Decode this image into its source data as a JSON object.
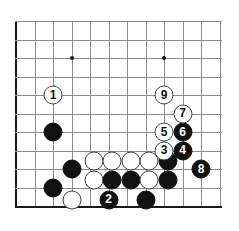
{
  "diagram": {
    "kind": "go-board-diagram",
    "title": "",
    "caption": "",
    "board": {
      "cell": 18.5,
      "origin_x": 16,
      "origin_y": 21,
      "cols": 12,
      "rows": 11,
      "line_color": "#8c8c8c",
      "edge_color": "#1a1a1a",
      "background": "#ffffff",
      "star_points": [
        {
          "col": 3,
          "row": 2
        },
        {
          "col": 8,
          "row": 2
        }
      ]
    },
    "colors": {
      "black_stone": "#111111",
      "white_stone": "#ffffff",
      "white_stone_border": "#444444",
      "black_label": "#ffffff",
      "white_label": "#111111"
    },
    "move_count": 9,
    "moves": [
      {
        "n": "1",
        "color": "white",
        "col": 2,
        "row": 4
      },
      {
        "n": "2",
        "color": "black",
        "col": 5,
        "row": 9.65
      },
      {
        "n": "3",
        "color": "white",
        "col": 8,
        "row": 7
      },
      {
        "n": "4",
        "color": "black",
        "col": 9,
        "row": 7
      },
      {
        "n": "5",
        "color": "white",
        "col": 8,
        "row": 6
      },
      {
        "n": "6",
        "color": "black",
        "col": 9,
        "row": 6
      },
      {
        "n": "7",
        "color": "white",
        "col": 9,
        "row": 5
      },
      {
        "n": "8",
        "color": "black",
        "col": 10,
        "row": 8
      },
      {
        "n": "9",
        "color": "white",
        "col": 8,
        "row": 4
      }
    ],
    "stones": [
      {
        "color": "black",
        "col": 2,
        "row": 6
      },
      {
        "color": "black",
        "col": 3,
        "row": 8
      },
      {
        "color": "black",
        "col": 2,
        "row": 9
      },
      {
        "color": "white",
        "col": 3,
        "row": 9.65
      },
      {
        "color": "white",
        "col": 4.2,
        "row": 7.55
      },
      {
        "color": "white",
        "col": 5.2,
        "row": 7.55
      },
      {
        "color": "white",
        "col": 6.2,
        "row": 7.55
      },
      {
        "color": "white",
        "col": 7.2,
        "row": 7.55
      },
      {
        "color": "black",
        "col": 8.2,
        "row": 7.55
      },
      {
        "color": "white",
        "col": 4.2,
        "row": 8.6
      },
      {
        "color": "black",
        "col": 5.2,
        "row": 8.6
      },
      {
        "color": "black",
        "col": 6.2,
        "row": 8.6
      },
      {
        "color": "white",
        "col": 7.2,
        "row": 8.6
      },
      {
        "color": "black",
        "col": 8.2,
        "row": 8.6
      },
      {
        "color": "black",
        "col": 7.0,
        "row": 9.65
      }
    ]
  }
}
